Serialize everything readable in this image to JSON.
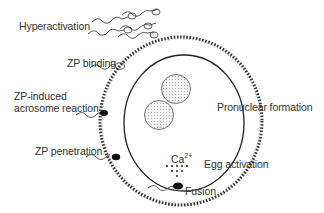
{
  "diagram": {
    "labels": {
      "hyperactivation": "Hyperactivation",
      "zp_binding": "ZP binding",
      "zp_induced_line1": "ZP-induced",
      "zp_induced_line2": "acrosome reaction",
      "zp_penetration": "ZP penetration",
      "pronuclear_formation": "Pronuclear formation",
      "ca_ion": "Ca",
      "ca_charge": "2+",
      "egg_activation": "Egg activation",
      "fusion": "Fusion"
    },
    "colors": {
      "line": "#222222",
      "text": "#333333",
      "pronucleus_fill": "#e6e6e6",
      "sperm_head": "#111111"
    }
  }
}
